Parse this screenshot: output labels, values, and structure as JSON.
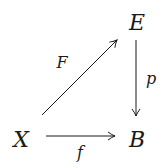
{
  "diagram": {
    "type": "commutative-diagram",
    "nodes": {
      "E": {
        "label": "E",
        "x": 137,
        "y": 29
      },
      "X": {
        "label": "X",
        "x": 21,
        "y": 146
      },
      "B": {
        "label": "B",
        "x": 137,
        "y": 146
      }
    },
    "arrows": [
      {
        "id": "F",
        "from": "X",
        "to": "E",
        "label": "F"
      },
      {
        "id": "p",
        "from": "E",
        "to": "B",
        "label": "p"
      },
      {
        "id": "f",
        "from": "X",
        "to": "B",
        "label": "f"
      }
    ],
    "colors": {
      "ink": "#1a1a1a",
      "background": "#ffffff"
    }
  }
}
